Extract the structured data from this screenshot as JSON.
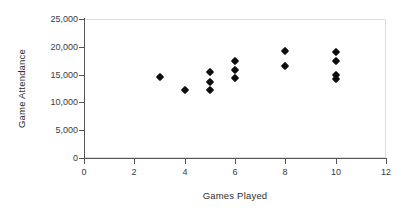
{
  "chart_data": {
    "type": "scatter",
    "title": "",
    "xlabel": "Games Played",
    "ylabel": "Game Attendance",
    "xlim": [
      0,
      12
    ],
    "ylim": [
      0,
      25000
    ],
    "grid": false,
    "legend": "none",
    "marker": "diamond",
    "marker_color": "#0d0d0d",
    "xticks": [
      "0",
      "2",
      "4",
      "6",
      "8",
      "10",
      "12"
    ],
    "xtick_values": [
      0,
      2,
      4,
      6,
      8,
      10,
      12
    ],
    "yticks": [
      "0",
      "5,000",
      "10,000",
      "15,000",
      "20,000",
      "25,000"
    ],
    "ytick_values": [
      0,
      5000,
      10000,
      15000,
      20000,
      25000
    ],
    "series": [
      {
        "name": "Game Attendance",
        "points": [
          {
            "x": 3,
            "y": 14500
          },
          {
            "x": 4,
            "y": 12300
          },
          {
            "x": 5,
            "y": 15500
          },
          {
            "x": 5,
            "y": 13700
          },
          {
            "x": 5,
            "y": 12200
          },
          {
            "x": 6,
            "y": 17500
          },
          {
            "x": 6,
            "y": 15800
          },
          {
            "x": 6,
            "y": 14400
          },
          {
            "x": 8,
            "y": 19300
          },
          {
            "x": 8,
            "y": 16500
          },
          {
            "x": 10,
            "y": 19000
          },
          {
            "x": 10,
            "y": 17400
          },
          {
            "x": 10,
            "y": 15000
          },
          {
            "x": 10,
            "y": 14300
          }
        ]
      }
    ]
  }
}
